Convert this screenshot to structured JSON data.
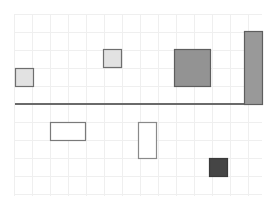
{
  "canvas": {
    "width": 271,
    "height": 204,
    "background": "#ffffff"
  },
  "grid": {
    "x0": 14,
    "y0": 14,
    "x1": 262,
    "y1": 196,
    "step": 18,
    "color": "#efefef"
  },
  "baseline": {
    "x1": 15,
    "x2": 262,
    "y": 104,
    "color": "#6a6a6a",
    "width": 2
  },
  "shapes": [
    {
      "id": "light-square-left",
      "x": 15,
      "y": 68,
      "w": 18,
      "h": 18,
      "fill": "#e2e2e2",
      "stroke": "#6e6e6e"
    },
    {
      "id": "light-square-mid",
      "x": 103,
      "y": 49,
      "w": 18,
      "h": 18,
      "fill": "#e2e2e2",
      "stroke": "#6e6e6e"
    },
    {
      "id": "gray-square-large",
      "x": 174,
      "y": 49,
      "w": 36,
      "h": 37,
      "fill": "#939393",
      "stroke": "#5e5e5e"
    },
    {
      "id": "gray-bar-tall",
      "x": 244,
      "y": 31,
      "w": 18,
      "h": 73,
      "fill": "#999999",
      "stroke": "#5e5e5e"
    },
    {
      "id": "white-rect-wide",
      "x": 50,
      "y": 122,
      "w": 35,
      "h": 18,
      "fill": "#ffffff",
      "stroke": "#7a7a7a"
    },
    {
      "id": "white-rect-tall",
      "x": 138,
      "y": 122,
      "w": 18,
      "h": 36,
      "fill": "#ffffff",
      "stroke": "#8a8a8a"
    },
    {
      "id": "dark-square",
      "x": 209,
      "y": 158,
      "w": 18,
      "h": 18,
      "fill": "#454545",
      "stroke": "#3a3a3a"
    }
  ]
}
